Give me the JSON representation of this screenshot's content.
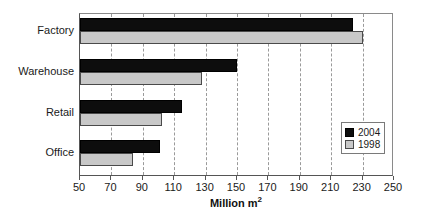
{
  "chart_data": {
    "type": "bar",
    "orientation": "horizontal",
    "title": "",
    "subtitle": "",
    "xlabel": "Million m²",
    "ylabel": "",
    "xlim": [
      50,
      250
    ],
    "xticks": [
      50,
      70,
      90,
      110,
      130,
      150,
      170,
      190,
      210,
      230,
      250
    ],
    "xtick_labels": [
      "50",
      "70",
      "90",
      "110",
      "130",
      "150",
      "170",
      "190",
      "210",
      "230",
      "250"
    ],
    "grid": "vertical-dashed",
    "legend_position": "inside-right",
    "categories": [
      "Factory",
      "Warehouse",
      "Retail",
      "Office"
    ],
    "series": [
      {
        "name": "2004",
        "color": "#0d0d0d",
        "values": [
          224,
          150,
          115,
          101
        ]
      },
      {
        "name": "1998",
        "color": "#c8c8c8",
        "values": [
          230,
          128,
          102,
          84
        ]
      }
    ]
  },
  "axis": {
    "x_title_main": "Million m",
    "x_title_sup": "2"
  },
  "legend": {
    "items": [
      {
        "label": "2004",
        "swatch": "black-square-swatch"
      },
      {
        "label": "1998",
        "swatch": "gray-square-swatch"
      }
    ]
  }
}
